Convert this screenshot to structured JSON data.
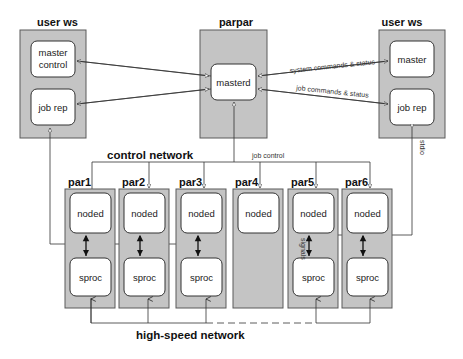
{
  "diagram": {
    "left_ws": {
      "title": "user ws",
      "procs": [
        "master",
        "control",
        "job rep"
      ]
    },
    "parpar": {
      "title": "parpar",
      "proc": "masterd"
    },
    "right_ws": {
      "title": "user ws",
      "procs": [
        "master",
        "job rep"
      ]
    },
    "edge_labels": {
      "system": "system commands & status",
      "job": "job commands & status",
      "job_control": "job control",
      "stdio": "stdio",
      "signals": "signals"
    },
    "networks": {
      "control": "control network",
      "high_speed": "high-speed network"
    },
    "nodes": [
      {
        "title": "par1",
        "upper": "noded",
        "lower": "sproc"
      },
      {
        "title": "par2",
        "upper": "noded",
        "lower": "sproc"
      },
      {
        "title": "par3",
        "upper": "noded",
        "lower": "sproc"
      },
      {
        "title": "par4",
        "upper": "noded",
        "lower": ""
      },
      {
        "title": "par5",
        "upper": "noded",
        "lower": "sproc"
      },
      {
        "title": "par6",
        "upper": "noded",
        "lower": "sproc"
      }
    ]
  }
}
